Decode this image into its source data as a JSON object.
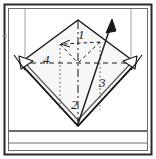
{
  "diagram": {
    "type": "origami-fold-instruction",
    "frame": {
      "outer_border_color": "#2b2b2b",
      "inner_border_color": "#555555",
      "background": "#ffffff",
      "baseline_band": "bottom horizontal strip"
    },
    "shape": {
      "name": "diamond",
      "description": "rotated square (kite base) centered in frame",
      "fill": "#f7f7f7",
      "stroke": "#1a1a1a"
    },
    "labels": [
      {
        "id": "label-1",
        "text": "1",
        "x": 78,
        "y": 35,
        "meaning": "first fold reference"
      },
      {
        "id": "label-2",
        "text": "2",
        "x": 72,
        "y": 104,
        "meaning": "second fold reference"
      },
      {
        "id": "label-3",
        "text": "3",
        "x": 100,
        "y": 82,
        "meaning": "third fold reference"
      },
      {
        "id": "label-4",
        "text": "4",
        "x": 45,
        "y": 58,
        "meaning": "fourth fold reference"
      }
    ],
    "line_styles": {
      "valley_fold": "dashed",
      "center_axis": "dash-dot",
      "hidden_edge": "dotted",
      "cut_or_edge": "solid"
    },
    "arrows": [
      {
        "id": "arrow-main",
        "style": "solid-filled",
        "direction": "up-right",
        "from": [
          78,
          118
        ],
        "to": [
          112,
          22
        ]
      },
      {
        "id": "arrow-fold-left",
        "style": "dashed",
        "direction": "left",
        "from": [
          101,
          41
        ],
        "to": [
          62,
          44
        ]
      },
      {
        "id": "arrowhead-left",
        "style": "hollow",
        "direction": "down-right",
        "x": 25,
        "y": 62
      },
      {
        "id": "arrowhead-right",
        "style": "hollow",
        "direction": "down-left",
        "x": 131,
        "y": 62
      }
    ],
    "guides": [
      {
        "id": "guide-left-vertical",
        "color": "#b8b8b8",
        "x": 25,
        "from_y": 8,
        "to_y": 58
      },
      {
        "id": "guide-right-vertical",
        "color": "#b8b8b8",
        "x": 131,
        "from_y": 8,
        "to_y": 58
      }
    ],
    "colors": {
      "ink": "#1a1a1a",
      "guide_gray": "#b8b8b8",
      "panel_fill": "#f7f7f7",
      "frame_dark": "#2b2b2b"
    }
  }
}
